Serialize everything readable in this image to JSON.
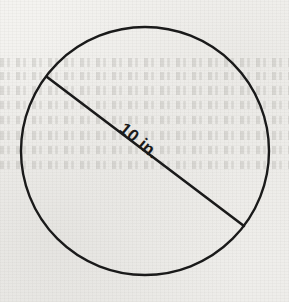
{
  "figure": {
    "background_color": "#f3f2ef",
    "ink_color": "#1a1a1a",
    "shapes": {
      "circle": {
        "name": "circle-outline",
        "center_x": 145,
        "center_y": 151,
        "radius": 124,
        "stroke_width": 2.4
      },
      "diameter": {
        "name": "diameter-segment",
        "x1": 47,
        "y1": 77,
        "x2": 244,
        "y2": 226,
        "stroke_width": 2.6,
        "angle_degrees": 37
      }
    },
    "labels": {
      "diameter_measure": "10 in.",
      "diameter_measure_value": 10,
      "diameter_measure_unit": "in.",
      "diameter_measure_rotation_degrees": 40
    },
    "ghost_bands": [
      {
        "top": 58,
        "height": 9
      },
      {
        "top": 72,
        "height": 8
      },
      {
        "top": 86,
        "height": 9
      },
      {
        "top": 101,
        "height": 8
      },
      {
        "top": 116,
        "height": 8
      },
      {
        "top": 131,
        "height": 9
      },
      {
        "top": 146,
        "height": 8
      },
      {
        "top": 161,
        "height": 8
      }
    ]
  }
}
